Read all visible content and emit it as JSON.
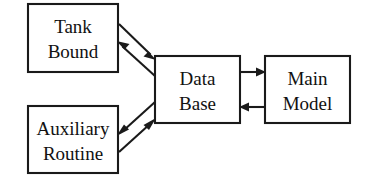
{
  "diagram": {
    "type": "block-flow-diagram",
    "background_color": "#ffffff",
    "line_color": "#1a1a1a",
    "text_color": "#111111",
    "nodes": [
      {
        "id": "tank-bound",
        "label_line1": "Tank",
        "label_line2": "Bound",
        "x": 28,
        "y": 4,
        "width": 90,
        "height": 68
      },
      {
        "id": "auxiliary-routine",
        "label_line1": "Auxiliary",
        "label_line2": "Routine",
        "x": 28,
        "y": 106,
        "width": 90,
        "height": 67
      },
      {
        "id": "data-base",
        "label_line1": "Data",
        "label_line2": "Base",
        "x": 155,
        "y": 56,
        "width": 85,
        "height": 67
      },
      {
        "id": "main-model",
        "label_line1": "Main",
        "label_line2": "Model",
        "x": 265,
        "y": 56,
        "width": 85,
        "height": 67
      }
    ],
    "edges": [
      {
        "id": "tank-bound-to-data-base",
        "from": "tank-bound",
        "to": "data-base",
        "direction": "forward"
      },
      {
        "id": "data-base-to-tank-bound",
        "from": "data-base",
        "to": "tank-bound",
        "direction": "forward"
      },
      {
        "id": "auxiliary-routine-to-data-base",
        "from": "auxiliary-routine",
        "to": "data-base",
        "direction": "forward"
      },
      {
        "id": "data-base-to-auxiliary-routine",
        "from": "data-base",
        "to": "auxiliary-routine",
        "direction": "forward"
      },
      {
        "id": "data-base-to-main-model",
        "from": "data-base",
        "to": "main-model",
        "direction": "forward"
      },
      {
        "id": "main-model-to-data-base",
        "from": "main-model",
        "to": "data-base",
        "direction": "forward"
      }
    ]
  }
}
